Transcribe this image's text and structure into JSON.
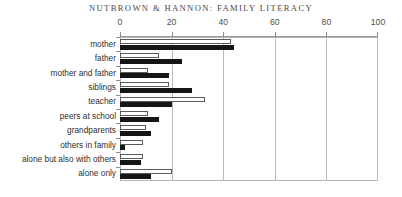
{
  "running_head": "NUTBROWN & HANNON: FAMILY LITERACY",
  "chart_data": {
    "type": "bar",
    "orientation": "horizontal",
    "title": "",
    "xlabel": "",
    "ylabel": "",
    "xlim": [
      0,
      100
    ],
    "xticks": [
      0,
      20,
      40,
      60,
      80,
      100
    ],
    "grid": true,
    "legend": "none",
    "categories": [
      "mother",
      "father",
      "mother and father",
      "siblings",
      "teacher",
      "peers at school",
      "grandparents",
      "others in family",
      "alone but also with others",
      "alone only"
    ],
    "series": [
      {
        "name": "series-1",
        "style": "hollow",
        "values": [
          43,
          15,
          11,
          19,
          33,
          11,
          10,
          9,
          9,
          20
        ]
      },
      {
        "name": "series-2",
        "style": "solid",
        "values": [
          44,
          24,
          19,
          28,
          20,
          15,
          12,
          2,
          8,
          12
        ]
      }
    ]
  },
  "colors": {
    "series_hollow_edge": "#5a5a5a",
    "series_solid": "#151515",
    "grid": "#b9b9b9",
    "frame": "#b4b4b4",
    "text": "#2f2f2f",
    "title": "#4a4a4a"
  }
}
